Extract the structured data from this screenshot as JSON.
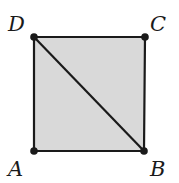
{
  "diagram": {
    "type": "square-with-diagonal",
    "fill_color": "#d9d9d9",
    "stroke_color": "#1a1a1a",
    "vertices": [
      {
        "label": "A",
        "x": 34,
        "y": 151
      },
      {
        "label": "B",
        "x": 144,
        "y": 151
      },
      {
        "label": "C",
        "x": 145,
        "y": 37
      },
      {
        "label": "D",
        "x": 34,
        "y": 37
      }
    ],
    "diagonal": {
      "from": "D",
      "to": "B"
    }
  },
  "labels": {
    "a": "A",
    "b": "B",
    "c": "C",
    "d": "D"
  }
}
